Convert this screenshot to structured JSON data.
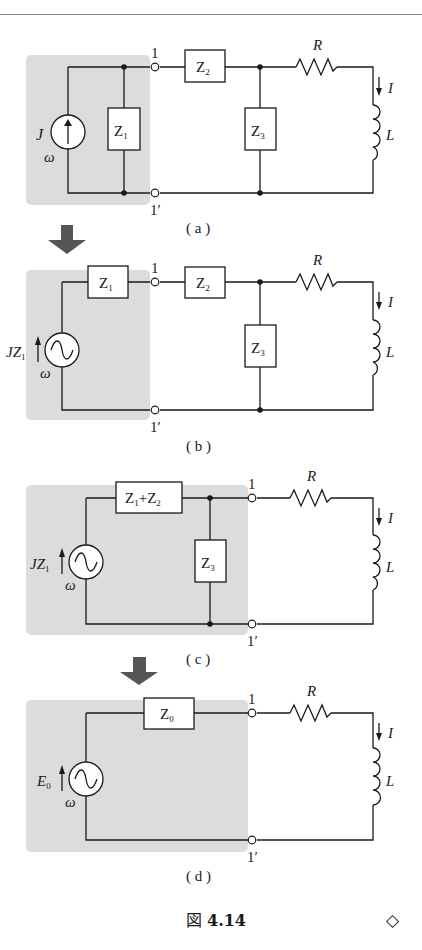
{
  "figure": {
    "caption_prefix": "図",
    "caption_number": "4.14",
    "end_mark": "◇"
  },
  "panels": [
    {
      "id": "a",
      "label": "( a )",
      "source": {
        "type": "current-source",
        "name": "J",
        "freq": "ω"
      },
      "elements": [
        "Z",
        "Z",
        "R",
        "L"
      ],
      "z1": {
        "base": "Z",
        "sub": "1"
      },
      "z2": {
        "base": "Z",
        "sub": "2"
      },
      "z3": {
        "base": "Z",
        "sub": "3"
      },
      "terminal_top": "1",
      "terminal_bottom": "1′",
      "resistor": "R",
      "inductor": "L",
      "current": "I"
    },
    {
      "id": "b",
      "label": "( b )",
      "source": {
        "type": "voltage-source",
        "name_base": "JZ",
        "name_sub": "1",
        "freq": "ω"
      },
      "z1": {
        "base": "Z",
        "sub": "1"
      },
      "z2": {
        "base": "Z",
        "sub": "2"
      },
      "z3": {
        "base": "Z",
        "sub": "3"
      },
      "terminal_top": "1",
      "terminal_bottom": "1′",
      "resistor": "R",
      "inductor": "L",
      "current": "I"
    },
    {
      "id": "c",
      "label": "( c )",
      "source": {
        "type": "voltage-source",
        "name_base": "JZ",
        "name_sub": "1",
        "freq": "ω"
      },
      "z12": {
        "a_base": "Z",
        "a_sub": "1",
        "plus": "+",
        "b_base": "Z",
        "b_sub": "2"
      },
      "z3": {
        "base": "Z",
        "sub": "3"
      },
      "terminal_top": "1",
      "terminal_bottom": "1′",
      "resistor": "R",
      "inductor": "L",
      "current": "I"
    },
    {
      "id": "d",
      "label": "( d )",
      "source": {
        "type": "voltage-source",
        "name_base": "E",
        "name_sub": "0",
        "freq": "ω"
      },
      "z0": {
        "base": "Z",
        "sub": "0"
      },
      "terminal_top": "1",
      "terminal_bottom": "1′",
      "resistor": "R",
      "inductor": "L",
      "current": "I"
    }
  ],
  "colors": {
    "shade": "#dcdcdc",
    "wire": "#1a1a1a",
    "arrow": "#555555"
  }
}
